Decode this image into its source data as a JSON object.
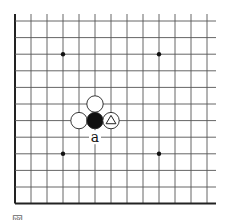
{
  "diagram": {
    "type": "go-board-fragment",
    "grid": {
      "columns": 13,
      "rows": 12,
      "col_x": [
        15,
        31,
        47,
        63,
        79,
        95,
        111,
        127,
        143,
        159,
        175,
        191,
        207
      ],
      "row_y": [
        21,
        37.6,
        54.2,
        70.8,
        87.4,
        104,
        120.6,
        137.2,
        153.8,
        170.4,
        187,
        203.6
      ],
      "top_y": 14,
      "right_x": 216,
      "left_edge_thick": true,
      "bottom_edge_thick": true,
      "line_color": "#555555",
      "edge_color": "#222222"
    },
    "star_points": [
      {
        "x": 63,
        "y": 54.2
      },
      {
        "x": 159,
        "y": 54.2
      },
      {
        "x": 63,
        "y": 153.8
      },
      {
        "x": 159,
        "y": 153.8
      }
    ],
    "stones": [
      {
        "color": "white",
        "x": 95,
        "y": 104,
        "mark": ""
      },
      {
        "color": "white",
        "x": 79,
        "y": 120.6,
        "mark": ""
      },
      {
        "color": "black",
        "x": 95,
        "y": 120.6,
        "mark": ""
      },
      {
        "color": "white",
        "x": 111,
        "y": 120.6,
        "mark": "triangle"
      }
    ],
    "labels": [
      {
        "text": "a",
        "x": 95,
        "y": 137.2
      }
    ],
    "stone_radius": 8.2
  },
  "caption": {
    "text": "図"
  }
}
